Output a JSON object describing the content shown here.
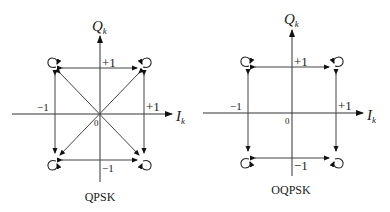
{
  "diagrams": [
    {
      "id": "qpsk",
      "caption": "QPSK",
      "axes": {
        "q_label": "Q",
        "q_sub": "k",
        "i_label": "I",
        "i_sub": "k",
        "origin": "0"
      },
      "ticks": {
        "top": "+1",
        "bottom": "−1",
        "left": "−1",
        "right": "+1"
      },
      "transitions": "square edges plus both diagonals through origin",
      "constellation_points": [
        [
          1,
          1
        ],
        [
          -1,
          1
        ],
        [
          -1,
          -1
        ],
        [
          1,
          -1
        ]
      ]
    },
    {
      "id": "oqpsk",
      "caption": "OQPSK",
      "axes": {
        "q_label": "Q",
        "q_sub": "k",
        "i_label": "I",
        "i_sub": "k",
        "origin": "0"
      },
      "ticks": {
        "top": "+1",
        "bottom": "−1",
        "left": "−1",
        "right": "+1"
      },
      "transitions": "square edges only (no diagonals)",
      "constellation_points": [
        [
          1,
          1
        ],
        [
          -1,
          1
        ],
        [
          -1,
          -1
        ],
        [
          1,
          -1
        ]
      ]
    }
  ]
}
